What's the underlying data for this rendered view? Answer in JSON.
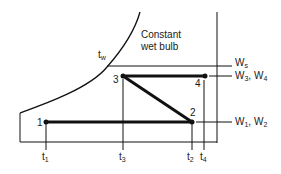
{
  "diagram": {
    "type": "psychrometric-process",
    "annotation": {
      "line1": "Constant",
      "line2": "wet bulb"
    },
    "curve_label": {
      "base": "t",
      "sub": "w"
    },
    "points": [
      {
        "id": "1",
        "label": "1"
      },
      {
        "id": "2",
        "label": "2"
      },
      {
        "id": "3",
        "label": "3"
      },
      {
        "id": "4",
        "label": "4"
      }
    ],
    "humidity_labels": {
      "ws": {
        "base": "W",
        "sub": "s"
      },
      "w34": {
        "a_base": "W",
        "a_sub": "3",
        "sep": ", ",
        "b_base": "W",
        "b_sub": "4"
      },
      "w12": {
        "a_base": "W",
        "a_sub": "1",
        "sep": ", ",
        "b_base": "W",
        "b_sub": "2"
      }
    },
    "temperature_labels": {
      "t1": {
        "base": "t",
        "sub": "1"
      },
      "t3": {
        "base": "t",
        "sub": "3"
      },
      "t2": {
        "base": "t",
        "sub": "2"
      },
      "t4": {
        "base": "t",
        "sub": "4"
      }
    },
    "colors": {
      "line": "#111111",
      "background": "#ffffff"
    }
  }
}
